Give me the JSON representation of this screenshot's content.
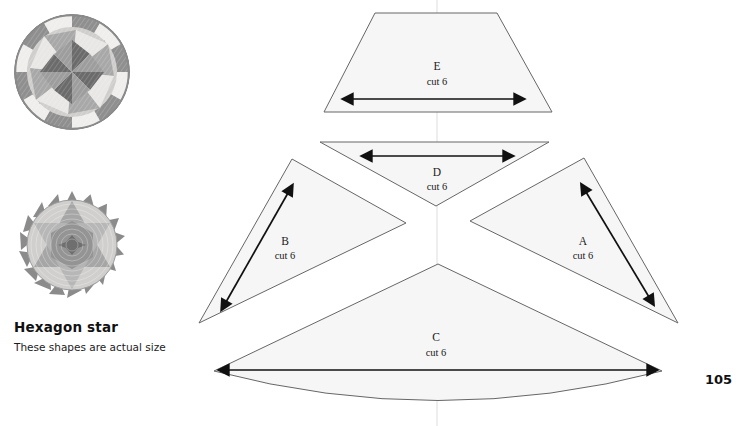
{
  "page": {
    "number": "105",
    "background": "#ffffff",
    "width": 740,
    "height": 426
  },
  "caption": {
    "title": "Hexagon star",
    "subtitle": "These shapes are actual size"
  },
  "photos": [
    {
      "name": "quilt-photo-pinwheel",
      "alt": "Round pinwheel quilted pincushion",
      "cx": 72,
      "cy": 72,
      "r": 58,
      "colors": [
        "#8d8d8d",
        "#b5b5b5",
        "#d8d8d8",
        "#f0efed",
        "#6e6e6e"
      ]
    },
    {
      "name": "quilt-photo-hexagon-star",
      "alt": "Hexagon star quilted pincushion",
      "cx": 72,
      "cy": 245,
      "r": 54,
      "colors": [
        "#9a9a9a",
        "#bdbdbd",
        "#dedede",
        "#efeeec",
        "#777777"
      ]
    }
  ],
  "pattern": {
    "fill_color": "#f6f6f6",
    "stroke_color": "#666666",
    "arrow_color": "#111111",
    "pieces": [
      {
        "id": "E",
        "label": "E",
        "cut": "cut 6",
        "shape": "trapezoid",
        "path": "M 375 13 L 497 13 L 552 112 L 324 112 Z",
        "label_x": 437,
        "label_y": 70,
        "sub_x": 437,
        "sub_y": 85,
        "arrow": {
          "x1": 352,
          "y1": 99,
          "x2": 515,
          "y2": 99,
          "heads": "both"
        }
      },
      {
        "id": "D",
        "label": "D",
        "cut": "cut 6",
        "shape": "triangle",
        "path": "M 320 142 L 549 142 L 436 206 Z",
        "label_x": 437,
        "label_y": 176,
        "sub_x": 437,
        "sub_y": 190,
        "arrow": {
          "x1": 371,
          "y1": 156,
          "x2": 504,
          "y2": 156,
          "heads": "both"
        }
      },
      {
        "id": "B",
        "label": "B",
        "cut": "cut 6",
        "shape": "triangle",
        "path": "M 292 159 L 406 223 L 199 323 Z",
        "label_x": 285,
        "label_y": 245,
        "sub_x": 285,
        "sub_y": 259,
        "arrow": {
          "x1": 226,
          "y1": 302,
          "x2": 288,
          "y2": 193,
          "heads": "both"
        }
      },
      {
        "id": "A",
        "label": "A",
        "cut": "cut 6",
        "shape": "triangle",
        "path": "M 584 158 L 678 323 L 470 221 Z",
        "label_x": 583,
        "label_y": 245,
        "sub_x": 583,
        "sub_y": 259,
        "arrow": {
          "x1": 586,
          "y1": 192,
          "x2": 649,
          "y2": 297,
          "heads": "both"
        }
      },
      {
        "id": "C",
        "label": "C",
        "cut": "cut 6",
        "shape": "curved-wedge",
        "path": "M 438 264 L 662 371 Q 438 430 214 371 Z",
        "label_x": 436,
        "label_y": 341,
        "sub_x": 436,
        "sub_y": 356,
        "arrow": {
          "x1": 228,
          "y1": 370,
          "x2": 648,
          "y2": 370,
          "heads": "both"
        }
      }
    ],
    "fold_line": {
      "x": 437,
      "y1": 0,
      "y2": 426
    }
  }
}
